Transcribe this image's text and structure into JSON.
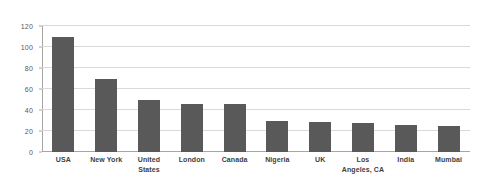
{
  "chart_data": {
    "type": "bar",
    "title": "",
    "xlabel": "",
    "ylabel": "",
    "ylim": [
      0,
      120
    ],
    "ytick_step": 20,
    "yticks": [
      "0",
      "20",
      "40",
      "60",
      "80",
      "100",
      "120"
    ],
    "grid": true,
    "legend": false,
    "categories": [
      "USA",
      "New York",
      "United States",
      "London",
      "Canada",
      "Nigeria",
      "UK",
      "Los\nAngeles, CA",
      "India",
      "Mumbai"
    ],
    "values": [
      110,
      70,
      49.5,
      46,
      46,
      30,
      29,
      28,
      26,
      25
    ],
    "bar_color": "#595959",
    "grid_color": "#d9d9d9",
    "axis_color": "#a6a6a6",
    "background_color": "#ffffff",
    "text_color": "#404040"
  }
}
